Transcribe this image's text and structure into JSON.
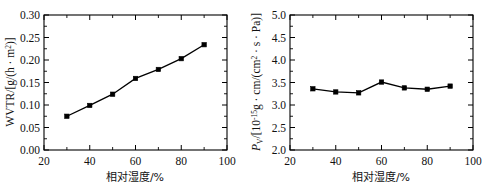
{
  "figure": {
    "panels": [
      "wvtr-panel",
      "pv-panel"
    ]
  },
  "chart_data": [
    {
      "type": "line",
      "name": "WVTR vs relative humidity",
      "title": "",
      "xlabel": "相对湿度/%",
      "ylabel": "WVTR/[g/(h · m²)]",
      "ylabel_parts": {
        "main": "WVTR/[g/(h · m",
        "exponent": "2",
        "tail": ")]"
      },
      "x": [
        30,
        40,
        50,
        60,
        70,
        80,
        90
      ],
      "values": [
        0.075,
        0.099,
        0.124,
        0.159,
        0.179,
        0.203,
        0.234
      ],
      "xlim": [
        20,
        100
      ],
      "ylim": [
        0.0,
        0.3
      ],
      "xticks": [
        20,
        40,
        60,
        80,
        100
      ],
      "xtick_labels": [
        "20",
        "40",
        "60",
        "80",
        "100"
      ],
      "yticks": [
        0.0,
        0.05,
        0.1,
        0.15,
        0.2,
        0.25,
        0.3
      ],
      "ytick_labels": [
        "0.00",
        "0.05",
        "0.10",
        "0.15",
        "0.20",
        "0.25",
        "0.30"
      ],
      "x_minor_ticks": [
        30,
        50,
        70,
        90
      ],
      "grid": false,
      "legend": "none",
      "marker": "square",
      "marker_color": "#000000",
      "line_color": "#000000"
    },
    {
      "type": "line",
      "name": "Pv vs relative humidity",
      "title": "",
      "xlabel": "相对湿度/%",
      "ylabel": "Pv/[10⁻¹⁵g · cm/(cm² · s · Pa)]",
      "ylabel_parts": {
        "symbol": "P",
        "subscript": "V",
        "open": "/[10",
        "exponent": "-15",
        "mid": "g · cm/(cm",
        "exponent2": "2",
        "tail": " · s · Pa)]"
      },
      "x": [
        30,
        40,
        50,
        60,
        70,
        80,
        90
      ],
      "values": [
        3.36,
        3.29,
        3.27,
        3.51,
        3.38,
        3.35,
        3.42
      ],
      "xlim": [
        20,
        100
      ],
      "ylim": [
        2.0,
        5.0
      ],
      "xticks": [
        20,
        40,
        60,
        80,
        100
      ],
      "xtick_labels": [
        "20",
        "40",
        "60",
        "80",
        "100"
      ],
      "yticks": [
        2.0,
        2.5,
        3.0,
        3.5,
        4.0,
        4.5,
        5.0
      ],
      "ytick_labels": [
        "2.0",
        "2.5",
        "3.0",
        "3.5",
        "4.0",
        "4.5",
        "5.0"
      ],
      "x_minor_ticks": [
        30,
        50,
        70,
        90
      ],
      "grid": false,
      "legend": "none",
      "marker": "square",
      "marker_color": "#000000",
      "line_color": "#000000"
    }
  ]
}
